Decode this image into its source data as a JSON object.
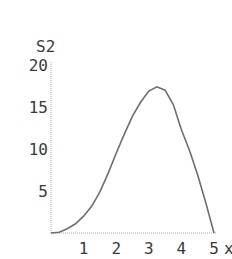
{
  "chart_data": {
    "type": "line",
    "title": "",
    "xlabel": "x",
    "ylabel": "S2",
    "xlim": [
      0,
      5
    ],
    "ylim": [
      0,
      20
    ],
    "x_ticks": [
      1,
      2,
      3,
      4,
      5
    ],
    "y_ticks": [
      5,
      10,
      15,
      20
    ],
    "grid": false,
    "legend": null,
    "series": [
      {
        "name": "S2",
        "x": [
          0,
          0.25,
          0.5,
          0.75,
          1,
          1.25,
          1.5,
          1.75,
          2,
          2.25,
          2.5,
          2.75,
          3,
          3.25,
          3.5,
          3.75,
          4,
          4.25,
          4.5,
          4.75,
          5
        ],
        "values": [
          0,
          0.1,
          0.5,
          1.1,
          2.0,
          3.2,
          4.9,
          7.1,
          9.5,
          11.8,
          13.9,
          15.6,
          16.9,
          17.4,
          17.0,
          15.3,
          12.3,
          9.8,
          6.9,
          3.6,
          0
        ]
      }
    ]
  },
  "axis": {
    "x_label": "x",
    "y_label": "S2",
    "x_tick_labels": [
      "1",
      "2",
      "3",
      "4",
      "5"
    ],
    "y_tick_labels": [
      "5",
      "10",
      "15",
      "20"
    ]
  },
  "style": {
    "line_color": "#6e6e6e",
    "axis_color": "#9a9a9a",
    "text_color": "#3a3a3a"
  }
}
